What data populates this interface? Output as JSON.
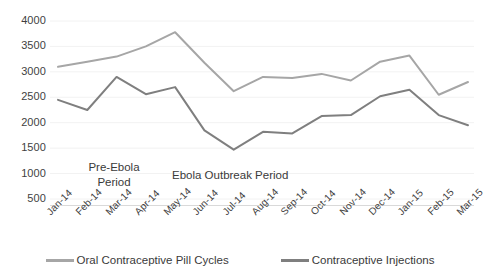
{
  "chart_data": {
    "type": "line",
    "title": "",
    "xlabel": "",
    "ylabel": "",
    "ylim": [
      0,
      4000
    ],
    "yticks": [
      500,
      1000,
      1500,
      2000,
      2500,
      3000,
      3500,
      4000
    ],
    "grid": true,
    "legend_position": "bottom",
    "categories": [
      "Jan-14",
      "Feb-14",
      "Mar-14",
      "Apr-14",
      "May-14",
      "Jun-14",
      "Jul-14",
      "Aug-14",
      "Sep-14",
      "Oct-14",
      "Nov-14",
      "Dec-14",
      "Jan-15",
      "Feb-15",
      "Mar-15"
    ],
    "series": [
      {
        "name": "Oral Contraceptive Pill Cycles",
        "color": "#a6a6a6",
        "values": [
          3100,
          3200,
          3300,
          3500,
          3780,
          3180,
          2620,
          2900,
          2880,
          2960,
          2830,
          3200,
          3320,
          2550,
          2800
        ]
      },
      {
        "name": "Contraceptive Injections",
        "color": "#7f7f7f",
        "values": [
          2450,
          2250,
          2900,
          2560,
          2700,
          1850,
          1470,
          1820,
          1790,
          2130,
          2150,
          2520,
          2650,
          2150,
          1950
        ]
      }
    ],
    "annotations": [
      {
        "id": "pre-ebola",
        "text": "Pre-Ebola\nPeriod"
      },
      {
        "id": "outbreak",
        "text": "Ebola Outbreak Period"
      }
    ]
  },
  "axis": {
    "y_tick_labels": [
      "4000",
      "3500",
      "3000",
      "2500",
      "2000",
      "1500",
      "1000",
      "500"
    ],
    "x_tick_labels": [
      "Jan-14",
      "Feb-14",
      "Mar-14",
      "Apr-14",
      "May-14",
      "Jun-14",
      "Jul-14",
      "Aug-14",
      "Sep-14",
      "Oct-14",
      "Nov-14",
      "Dec-14",
      "Jan-15",
      "Feb-15",
      "Mar-15"
    ]
  },
  "annotations": {
    "pre_ebola": "Pre-Ebola\nPeriod",
    "outbreak": "Ebola Outbreak Period"
  },
  "legend": {
    "items": [
      {
        "label": "Oral Contraceptive Pill Cycles",
        "color": "#a6a6a6"
      },
      {
        "label": "Contraceptive Injections",
        "color": "#7f7f7f"
      }
    ]
  },
  "colors": {
    "oral_pill_line": "#a6a6a6",
    "injection_line": "#7f7f7f",
    "gridline": "#f2f2f2",
    "axis_line": "#d9d9d9",
    "text": "#3a3a3a",
    "background": "#ffffff"
  }
}
